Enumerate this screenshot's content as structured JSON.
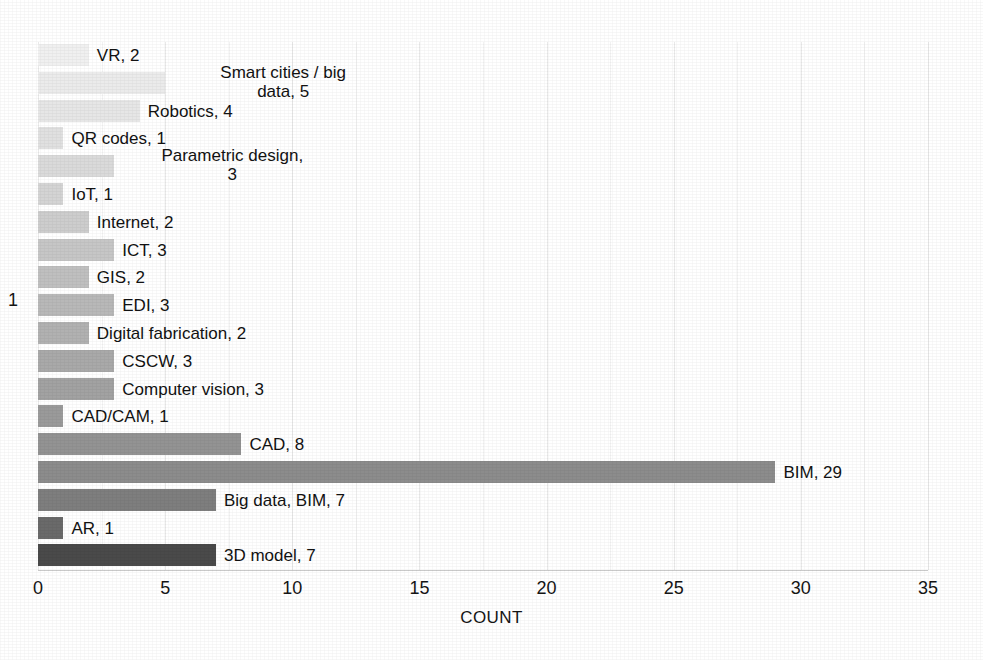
{
  "chart_data": {
    "type": "bar",
    "orientation": "horizontal",
    "title": "",
    "xlabel": "COUNT",
    "ylabel": "1",
    "xlim": [
      0,
      35
    ],
    "xticks": [
      "0",
      "5",
      "10",
      "15",
      "20",
      "25",
      "30",
      "35"
    ],
    "grid": true,
    "legend": "none",
    "categories": [
      "VR",
      "Smart cities / big data",
      "Robotics",
      "QR codes",
      "Parametric design",
      "IoT",
      "Internet",
      "ICT",
      "GIS",
      "EDI",
      "Digital fabrication",
      "CSCW",
      "Computer vision",
      "CAD/CAM",
      "CAD",
      "BIM",
      "Big data, BIM",
      "AR",
      "3D model"
    ],
    "values": [
      2,
      5,
      4,
      1,
      3,
      1,
      2,
      3,
      2,
      3,
      2,
      3,
      3,
      1,
      8,
      29,
      7,
      1,
      7
    ],
    "data_labels": [
      "VR, 2",
      "Smart cities / big\ndata, 5",
      "Robotics, 4",
      "QR codes, 1",
      "Parametric design,\n3",
      "IoT, 1",
      "Internet, 2",
      "ICT, 3",
      "GIS, 2",
      "EDI, 3",
      "Digital fabrication, 2",
      "CSCW, 3",
      "Computer vision, 3",
      "CAD/CAM, 1",
      "CAD, 8",
      "BIM, 29",
      "Big data, BIM, 7",
      "AR, 1",
      "3D model, 7"
    ],
    "bar_colors": [
      "#f0f0f0",
      "#ebebeb",
      "#e6e6e6",
      "#e0e0e0",
      "#dadada",
      "#d4d4d4",
      "#cdcdcd",
      "#c6c6c6",
      "#bfbfbf",
      "#b8b8b8",
      "#b1b1b1",
      "#a9a9a9",
      "#a2a2a2",
      "#9a9a9a",
      "#939393",
      "#8c8c8c",
      "#7e7e7e",
      "#6a6a6a",
      "#4a4a4a"
    ],
    "accent_color": "#8c8c8c",
    "axis_color": "#c9c9c9",
    "grid_color": "#e9e9e9",
    "text_color": "#121212"
  }
}
